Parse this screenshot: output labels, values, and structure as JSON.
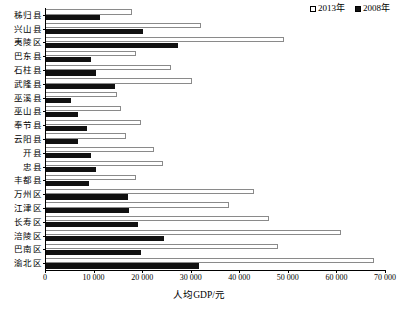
{
  "chart_data": {
    "type": "bar",
    "orientation": "horizontal",
    "title": "",
    "xlabel": "人均GDP/元",
    "ylabel": "",
    "xlim": [
      0,
      70000
    ],
    "xticks": [
      "0",
      "10 000",
      "20 000",
      "30 000",
      "40 000",
      "50 000",
      "60 000",
      "70 000"
    ],
    "xtick_values": [
      0,
      10000,
      20000,
      30000,
      40000,
      50000,
      60000,
      70000
    ],
    "grid": false,
    "legend_position": "top-right",
    "categories": [
      "秭归县",
      "兴山县",
      "夷陵区",
      "巴东县",
      "石柱县",
      "武隆县",
      "巫溪县",
      "巫山县",
      "奉节县",
      "云阳县",
      "开县",
      "忠县",
      "丰都县",
      "万州区",
      "江津区",
      "长寿区",
      "涪陵区",
      "巴南区",
      "渝北区"
    ],
    "series": [
      {
        "name": "2013年",
        "color": "#ffffff",
        "edge_color": "#8a8a8a",
        "values": [
          17700,
          31900,
          49000,
          18500,
          25700,
          30000,
          14600,
          15500,
          19600,
          16500,
          22200,
          24100,
          18500,
          42800,
          37600,
          45900,
          60700,
          47700,
          67500
        ]
      },
      {
        "name": "2008年",
        "color": "#111111",
        "edge_color": "#111111",
        "values": [
          11100,
          19900,
          27200,
          9300,
          10300,
          14200,
          5100,
          6600,
          8400,
          6600,
          9300,
          10300,
          8800,
          16900,
          17100,
          18900,
          24300,
          19600,
          31500
        ]
      }
    ]
  },
  "legend": {
    "items": [
      {
        "label": "2013年",
        "swatch": "white-square"
      },
      {
        "label": "2008年",
        "swatch": "black-square"
      }
    ]
  }
}
